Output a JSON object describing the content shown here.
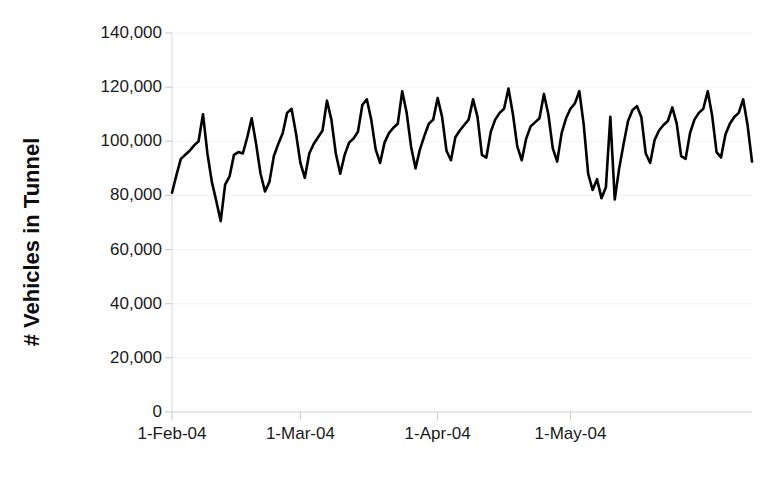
{
  "chart_data": {
    "type": "line",
    "title": "",
    "subtitle": "",
    "xlabel": "",
    "ylabel": "# Vehicles in Tunnel",
    "ylim": [
      0,
      140000
    ],
    "y_ticks": [
      0,
      20000,
      40000,
      60000,
      80000,
      100000,
      120000,
      140000
    ],
    "y_tick_labels": [
      "0",
      "20,000",
      "40,000",
      "60,000",
      "80,000",
      "100,000",
      "120,000",
      "140,000"
    ],
    "x_tick_labels": [
      "1-Feb-04",
      "1-Mar-04",
      "1-Apr-04",
      "1-May-04"
    ],
    "x_tick_indices": [
      0,
      29,
      60,
      90
    ],
    "xlim": [
      0,
      104
    ],
    "grid": true,
    "legend": null,
    "legend_position": "none",
    "line_color": "#000000",
    "background_color": "#ffffff",
    "series": [
      {
        "name": "Vehicles in Tunnel",
        "start_date": "1-Feb-04",
        "end_date": "15-May-04",
        "values": [
          81000,
          87500,
          93500,
          95000,
          96500,
          98500,
          100000,
          110000,
          95500,
          85000,
          78000,
          70500,
          84000,
          87000,
          95000,
          96000,
          95500,
          101500,
          108500,
          99000,
          88000,
          81500,
          85000,
          94500,
          99000,
          103000,
          110500,
          112000,
          103000,
          92000,
          86500,
          95500,
          99000,
          101500,
          104000,
          115000,
          108000,
          95500,
          88000,
          95000,
          99500,
          101000,
          103500,
          113500,
          115500,
          108000,
          97000,
          92000,
          99500,
          103000,
          105000,
          106500,
          118500,
          110500,
          98000,
          90000,
          97000,
          102000,
          106500,
          108000,
          116000,
          109000,
          96500,
          93000,
          101500,
          104000,
          106000,
          108000,
          115500,
          109000,
          95000,
          94000,
          103500,
          108000,
          110500,
          112000,
          119500,
          110000,
          98000,
          93000,
          101000,
          105500,
          107000,
          108500,
          117500,
          110000,
          97500,
          92500,
          103000,
          108500,
          112000,
          114000,
          118500,
          106000,
          88000,
          82000,
          86000,
          79000,
          83000,
          109000,
          78500,
          90000,
          99000,
          107500,
          111500,
          113000,
          109000,
          95500,
          92000,
          100500,
          104000,
          106000,
          107500,
          112500,
          106500,
          94500,
          93500,
          103000,
          108000,
          110500,
          112000,
          118500,
          109500,
          96000,
          94000,
          102500,
          106500,
          109000,
          110500,
          115500,
          106000,
          92500
        ],
        "min_value": 70500,
        "max_value": 119500,
        "approx_weekday_peak_range": [
          110000,
          120000
        ],
        "approx_weekend_trough_range": [
          78000,
          95000
        ]
      }
    ],
    "annotations": [
      {
        "label": "anomalous mid-April dip cluster",
        "approx_x_range": [
          "mid-Apr-04",
          "late-Apr-04"
        ],
        "approx_y_range": [
          78000,
          109000
        ]
      },
      {
        "label": "deepest trough",
        "value": 70500,
        "approx_date": "mid-Feb-04"
      }
    ]
  }
}
